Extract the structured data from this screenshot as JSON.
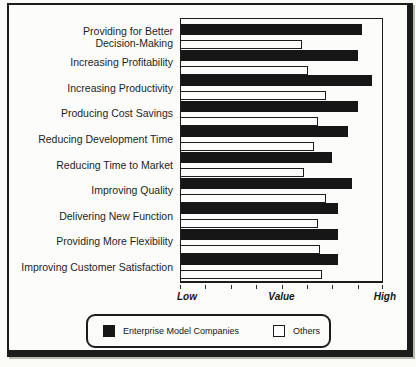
{
  "figure": {
    "background": "#fbfbf8",
    "frame_color": "#1c1c1c"
  },
  "chart_data": {
    "type": "bar",
    "orientation": "horizontal",
    "title": "",
    "categories": [
      "Providing for Better\nDecision-Making",
      "Increasing Profitability",
      "Increasing Productivity",
      "Producing Cost Savings",
      "Reducing Development Time",
      "Reducing Time to Market",
      "Improving Quality",
      "Delivering New Function",
      "Providing More Flexibility",
      "Improving Customer Satisfaction"
    ],
    "series": [
      {
        "name": "Enterprise Model Companies",
        "color": "#161616",
        "values": [
          90,
          88,
          95,
          88,
          83,
          75,
          85,
          78,
          78,
          78
        ]
      },
      {
        "name": "Others",
        "color": "#ffffff",
        "values": [
          60,
          63,
          72,
          68,
          66,
          61,
          72,
          68,
          69,
          70
        ]
      }
    ],
    "values_unit": "percent_of_axis_length",
    "axis_labels": [
      "Low",
      "Value",
      "High"
    ],
    "xlim": [
      0,
      100
    ],
    "tick_count": 9,
    "grid": false,
    "legend_position": "bottom"
  },
  "colors": {
    "bar_fill_enterprise": "#161616",
    "bar_fill_others": "#ffffff",
    "bar_outline": "#1c1c1c",
    "plot_border": "#1c1c1c"
  }
}
